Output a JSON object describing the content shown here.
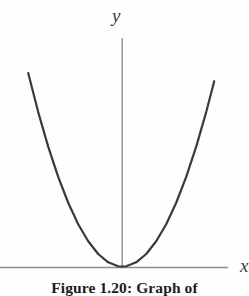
{
  "figure": {
    "caption": "Figure 1.20: Graph of",
    "background_color": "#fefefe",
    "curve_color": "#3a3a3a",
    "axis_color": "#8c8c8c",
    "text_color": "#1c1c1c"
  },
  "axes": {
    "y_label": "y",
    "x_label": "x"
  },
  "chart_data": {
    "type": "line",
    "title": "Figure 1.20: Graph of",
    "xlabel": "x",
    "ylabel": "y",
    "grid": false,
    "legend": null,
    "xlim": [
      -5,
      5
    ],
    "ylim": [
      0,
      25
    ],
    "series": [
      {
        "name": "y = x^2",
        "x": [
          -4.7,
          -4.2,
          -3.7,
          -3.2,
          -2.7,
          -2.2,
          -1.7,
          -1.2,
          -0.7,
          -0.2,
          0,
          0.2,
          0.7,
          1.2,
          1.7,
          2.2,
          2.7,
          3.2,
          3.7,
          4.2,
          4.6
        ],
        "y": [
          22.09,
          17.64,
          13.69,
          10.24,
          7.29,
          4.84,
          2.89,
          1.44,
          0.49,
          0.04,
          0,
          0.04,
          0.49,
          1.44,
          2.89,
          4.84,
          7.29,
          10.24,
          13.69,
          17.64,
          21.16
        ]
      }
    ],
    "annotations": [
      {
        "text": "y",
        "role": "y-axis-label"
      },
      {
        "text": "x",
        "role": "x-axis-label"
      }
    ]
  }
}
